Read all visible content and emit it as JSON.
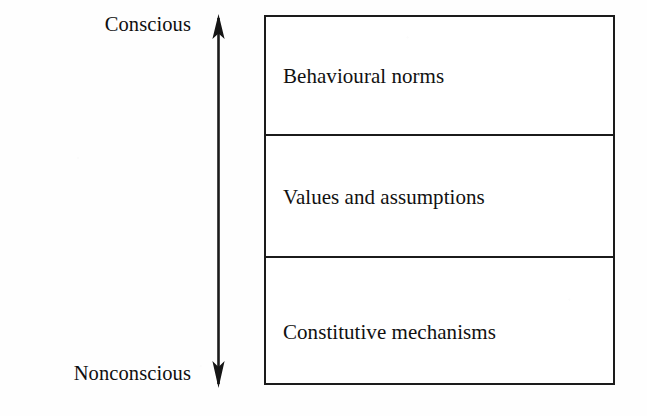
{
  "diagram": {
    "type": "layered-stack-with-continuum-axis",
    "background_color": "#fefefe",
    "line_color": "#1b1b1b",
    "text_color": "#111111",
    "axis": {
      "orientation": "vertical",
      "arrowheads": "both",
      "top_label": "Conscious",
      "bottom_label": "Nonconscious",
      "top_arrow_icon": "arrow-up-icon",
      "bottom_arrow_icon": "arrow-down-icon"
    },
    "layers": [
      {
        "label": "Behavioural norms"
      },
      {
        "label": "Values and assumptions"
      },
      {
        "label": "Constitutive mechanisms"
      }
    ]
  }
}
